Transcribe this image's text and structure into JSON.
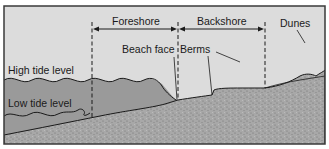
{
  "diagram": {
    "zones": [
      {
        "label": "Foreshore",
        "from_x": 92,
        "to_x": 178
      },
      {
        "label": "Backshore",
        "from_x": 178,
        "to_x": 265
      }
    ],
    "features": [
      {
        "label": "Beach face"
      },
      {
        "label": "Berms"
      },
      {
        "label": "Dunes"
      }
    ],
    "water_levels": [
      {
        "label": "High tide level"
      },
      {
        "label": "Low tide level"
      }
    ],
    "colors": {
      "sky": "#dcdcdc",
      "water": "#9a9a9a",
      "sand": "#a6a6a6",
      "line": "#1a1a1a",
      "frame": "#3a3a3a"
    }
  }
}
